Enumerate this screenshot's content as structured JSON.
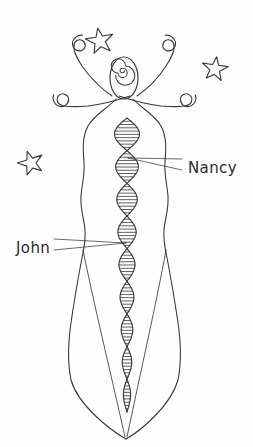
{
  "drawing": {
    "title": "Hand-drawn DNA figure sketch",
    "background_color": "#fefefe",
    "ink_color": "#3a3a3a",
    "text_color": "#2b2b2b",
    "medium": "pencil-sketch"
  },
  "labels": [
    {
      "id": "nancy",
      "text": "Nancy",
      "x": 188,
      "y": 168,
      "anchor_point": {
        "x": 128,
        "y": 158
      },
      "leader_lines": 2
    },
    {
      "id": "john",
      "text": "John",
      "x": 16,
      "y": 248,
      "anchor_point": {
        "x": 126,
        "y": 243
      },
      "leader_lines": 2
    }
  ],
  "figure": {
    "name": "goddess-dna-figure",
    "head": {
      "shape": "oval",
      "center_x": 124,
      "center_y": 78,
      "rx": 14,
      "ry": 21,
      "inner_motif": "spiral"
    },
    "arms": {
      "count": 4,
      "style": "curled-spiral-tendrils",
      "description": "two upper raised arms and two lower outward arms, each ending in a spiral curl"
    },
    "body": {
      "silhouette": "wavy-hourglass-taper-to-point",
      "top_y": 105,
      "bottom_tip_y": 438,
      "widest_y": 190,
      "widest_half_width": 46
    },
    "helix": {
      "type": "dna-double-helix",
      "top_y": 118,
      "bottom_y": 412,
      "lobes": 9,
      "rungs_per_lobe": 9,
      "max_half_width": 13,
      "min_half_width": 3,
      "center_x": 127
    }
  },
  "stars": [
    {
      "id": "star-top-left",
      "cx": 100,
      "cy": 41,
      "r": 14,
      "points": 5,
      "rotation": -10
    },
    {
      "id": "star-top-right",
      "cx": 215,
      "cy": 69,
      "r": 13,
      "points": 5,
      "rotation": 8
    },
    {
      "id": "star-mid-left",
      "cx": 31,
      "cy": 163,
      "r": 13,
      "points": 5,
      "rotation": -18
    }
  ]
}
